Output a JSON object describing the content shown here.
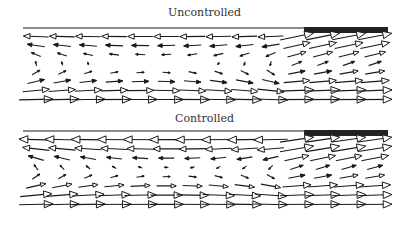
{
  "figure": {
    "panels": [
      {
        "title": "Uncontrolled"
      },
      {
        "title": "Controlled"
      }
    ]
  },
  "chart_data": [
    {
      "type": "quiver",
      "title": "Uncontrolled",
      "xlabel": "",
      "ylabel": "",
      "grid": false,
      "description": "Velocity vector field in a channel; leftward flow near the top wall, rightward flow near the bottom, recirculation cell in the middle; dark wall segment on the top-right (x from ~0.77 to 1.0).",
      "wall_segment": {
        "x_start": 0.77,
        "x_end": 1.0,
        "position": "top"
      },
      "grid_points": {
        "nx": 14,
        "ny": 8
      },
      "field": {
        "top_speed": 0.6,
        "bottom_speed": 1.0,
        "vortex_center": [
          0.35,
          0.35
        ]
      }
    },
    {
      "type": "quiver",
      "title": "Controlled",
      "xlabel": "",
      "ylabel": "",
      "grid": false,
      "description": "Velocity vector field with control applied; stronger leftward flow at top wall and stronger, more uniform rightward flow near the bottom; dark wall segment on the top-right.",
      "wall_segment": {
        "x_start": 0.77,
        "x_end": 1.0,
        "position": "top"
      },
      "grid_points": {
        "nx": 14,
        "ny": 8
      },
      "field": {
        "top_speed": 0.9,
        "bottom_speed": 1.2,
        "vortex_center": [
          0.4,
          0.4
        ]
      }
    }
  ],
  "colors": {
    "ink": "#1a1a1a",
    "wall": "#222222"
  }
}
